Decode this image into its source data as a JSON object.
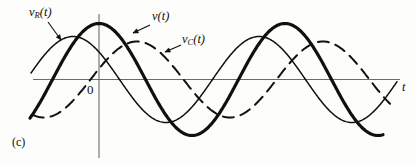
{
  "figure": {
    "caption": "(c)",
    "background_color": "#fdfdfc",
    "ink_color": "#12100e",
    "axis_color": "#6b6b6b"
  },
  "axes": {
    "x_axis_label": "t",
    "origin_label": "0",
    "x_axis_y_px": 79.5,
    "x_axis_x_start_px": 33,
    "x_axis_x_end_px": 400,
    "y_axis_x_px": 99,
    "y_axis_y_start_px": 14,
    "y_axis_y_end_px": 158
  },
  "labels": {
    "vr": {
      "base": "v",
      "sub": "R",
      "arg": "(t)"
    },
    "v": {
      "base": "v",
      "sub": "",
      "arg": "(t)"
    },
    "vc": {
      "base": "v",
      "sub": "C",
      "arg": "(t)"
    }
  },
  "leaders": [
    {
      "name": "leader-vr",
      "x1": 48,
      "y1": 22,
      "x2": 61,
      "y2": 40
    },
    {
      "name": "leader-v",
      "x1": 150,
      "y1": 25,
      "x2": 133,
      "y2": 33
    },
    {
      "name": "leader-vc",
      "x1": 181,
      "y1": 45,
      "x2": 165,
      "y2": 52
    }
  ],
  "chart_data": {
    "type": "line",
    "title": "",
    "xlabel": "t",
    "ylabel": "",
    "grid": false,
    "legend": "inline-annotations",
    "x_range_px": [
      30,
      400
    ],
    "baseline_y_px": 79.5,
    "period_px": 186,
    "series": [
      {
        "name": "v(t)",
        "label_key": "v",
        "style": "solid-thick",
        "stroke_width": 3.2,
        "color": "#12100e",
        "amplitude_px": 56,
        "phase_peak_x_px": 99,
        "x_start_px": 30,
        "x_end_px": 383,
        "peaks_px": [
          [
            99,
            23
          ],
          [
            285,
            23
          ]
        ],
        "troughs_px": [
          [
            192,
            136
          ],
          [
            378,
            136
          ]
        ],
        "zero_crossings_px": [
          53,
          146,
          239,
          332
        ]
      },
      {
        "name": "vR(t)",
        "label_key": "vr",
        "style": "solid-thin",
        "stroke_width": 1.5,
        "color": "#12100e",
        "amplitude_px": 43,
        "phase_peak_x_px": 73,
        "x_start_px": 31,
        "x_end_px": 397,
        "peaks_px": [
          [
            73,
            36
          ],
          [
            259,
            36
          ]
        ],
        "troughs_px": [
          [
            166,
            123
          ],
          [
            352,
            123
          ]
        ],
        "zero_crossings_px": [
          27,
          120,
          213,
          306,
          399
        ]
      },
      {
        "name": "vC(t)",
        "label_key": "vc",
        "style": "dashed",
        "stroke_width": 2.0,
        "dash_pattern": "11 7",
        "color": "#12100e",
        "amplitude_px": 38,
        "phase_peak_x_px": 137,
        "x_start_px": 33,
        "x_end_px": 390,
        "peaks_px": [
          [
            137,
            41
          ],
          [
            323,
            41
          ]
        ],
        "troughs_px": [
          [
            230,
            118
          ],
          [
            416,
            118
          ]
        ],
        "zero_crossings_px": [
          91,
          184,
          277,
          370
        ]
      }
    ]
  }
}
